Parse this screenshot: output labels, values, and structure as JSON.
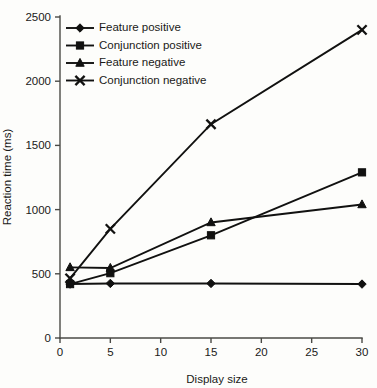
{
  "chart_data": {
    "type": "line",
    "title": "",
    "xlabel": "Display size",
    "ylabel": "Reaction time (ms)",
    "x": [
      1,
      5,
      15,
      30
    ],
    "xlim": [
      0,
      30
    ],
    "ylim": [
      0,
      2500
    ],
    "xticks": [
      0,
      5,
      10,
      15,
      20,
      25,
      30
    ],
    "xtick_labels": [
      "0",
      "5",
      "10",
      "15",
      "20",
      "25",
      "30"
    ],
    "yticks": [
      0,
      500,
      1000,
      1500,
      2000,
      2500
    ],
    "ytick_labels": [
      "0",
      "500",
      "1000",
      "1500",
      "2000",
      "2500"
    ],
    "grid": false,
    "legend_position": "top-left",
    "series": [
      {
        "name": "Feature positive",
        "marker": "diamond",
        "color": "#111110",
        "x": [
          1,
          5,
          15,
          30
        ],
        "values": [
          420,
          425,
          425,
          420
        ]
      },
      {
        "name": "Conjunction positive",
        "marker": "square",
        "color": "#111110",
        "x": [
          1,
          5,
          15,
          30
        ],
        "values": [
          420,
          505,
          800,
          1290
        ]
      },
      {
        "name": "Feature negative",
        "marker": "triangle",
        "color": "#111110",
        "x": [
          1,
          5,
          15,
          30
        ],
        "values": [
          550,
          545,
          900,
          1040
        ]
      },
      {
        "name": "Conjunction negative",
        "marker": "cross-x",
        "color": "#111110",
        "x": [
          1,
          5,
          15,
          30
        ],
        "values": [
          465,
          850,
          1665,
          2400
        ]
      }
    ]
  },
  "figure": {
    "background_color": "#fdfdfb",
    "axis_color": "#4a4a46",
    "ink_color": "#111110"
  }
}
